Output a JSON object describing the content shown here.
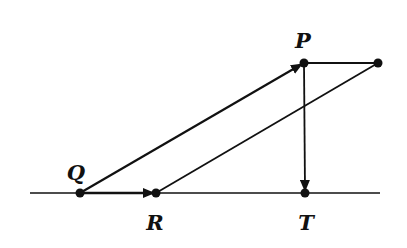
{
  "diagram": {
    "type": "vector-geometry",
    "background": "#ffffff",
    "stroke_color": "#111111",
    "points": {
      "Q": {
        "label": "Q",
        "x": 80,
        "y": 193
      },
      "R": {
        "label": "R",
        "x": 156,
        "y": 193
      },
      "T": {
        "label": "T",
        "x": 305,
        "y": 193
      },
      "P": {
        "label": "P",
        "x": 304,
        "y": 63
      },
      "S": {
        "label": "",
        "x": 378,
        "y": 63
      }
    },
    "labels": {
      "Q": "Q",
      "P": "P",
      "R": "R",
      "T": "T"
    },
    "baseline": {
      "x1": 30,
      "x2": 380,
      "y": 193
    },
    "vectors": [
      {
        "from": "Q",
        "to": "P",
        "arrow": true
      },
      {
        "from": "Q",
        "to": "R",
        "arrow": true
      },
      {
        "from": "P",
        "to": "T",
        "arrow": true
      }
    ],
    "segments": [
      {
        "from": "R",
        "to": "S"
      },
      {
        "from": "P",
        "to": "S"
      }
    ]
  }
}
